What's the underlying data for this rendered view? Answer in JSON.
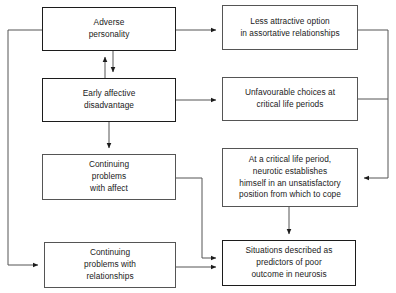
{
  "diagram": {
    "type": "flowchart",
    "colors": {
      "background": "#ffffff",
      "bold_border": "#1c1c1c",
      "thin_border": "#555555",
      "connector": "#555555",
      "text": "#1a1a1a"
    },
    "nodes": [
      {
        "id": "adverse-personality",
        "label": "Adverse\npersonality",
        "border": "bold",
        "column": "left",
        "row": 1
      },
      {
        "id": "less-attractive-option",
        "label": "Less attractive option\nin assortative relationships",
        "border": "thin",
        "column": "right",
        "row": 1
      },
      {
        "id": "early-affective-disadvantage",
        "label": "Early affective\ndisadvantage",
        "border": "bold",
        "column": "left",
        "row": 2
      },
      {
        "id": "unfavourable-choices",
        "label": "Unfavourable choices at\ncritical life periods",
        "border": "thin",
        "column": "right",
        "row": 2
      },
      {
        "id": "continuing-problems-affect",
        "label": "Continuing\nproblems\nwith affect",
        "border": "thin",
        "column": "left",
        "row": 3
      },
      {
        "id": "critical-life-period",
        "label": "At a critical life period,\nneurotic establishes\nhimself in an unsatisfactory\nposition from which to cope",
        "border": "thin",
        "column": "right",
        "row": 3
      },
      {
        "id": "continuing-problems-relationships",
        "label": "Continuing\nproblems with\nrelationships",
        "border": "thin",
        "column": "left",
        "row": 4
      },
      {
        "id": "situations-described",
        "label": "Situations described as\npredictors of poor\noutcome in neurosis",
        "border": "bold",
        "column": "right",
        "row": 4
      }
    ],
    "edges": [
      {
        "id": "adverse-to-less-attractive",
        "from": "adverse-personality",
        "to": "less-attractive-option",
        "arrow": "single"
      },
      {
        "id": "adverse-early-up",
        "from": "early-affective-disadvantage",
        "to": "adverse-personality",
        "arrow": "single"
      },
      {
        "id": "adverse-early-down",
        "from": "adverse-personality",
        "to": "early-affective-disadvantage",
        "arrow": "single"
      },
      {
        "id": "early-to-unfavourable",
        "from": "early-affective-disadvantage",
        "to": "unfavourable-choices",
        "arrow": "single"
      },
      {
        "id": "early-to-continuing-affect",
        "from": "early-affective-disadvantage",
        "to": "continuing-problems-affect",
        "arrow": "single"
      },
      {
        "id": "less-attractive-to-critical",
        "from": "less-attractive-option",
        "to": "critical-life-period",
        "arrow": "single"
      },
      {
        "id": "unfavourable-to-critical",
        "from": "unfavourable-choices",
        "to": "critical-life-period",
        "arrow": "single"
      },
      {
        "id": "critical-to-situations",
        "from": "critical-life-period",
        "to": "situations-described",
        "arrow": "single"
      },
      {
        "id": "affect-to-situations",
        "from": "continuing-problems-affect",
        "to": "situations-described",
        "arrow": "single"
      },
      {
        "id": "relationships-to-situations",
        "from": "continuing-problems-relationships",
        "to": "situations-described",
        "arrow": "single"
      },
      {
        "id": "adverse-to-relationships-feedback",
        "from": "adverse-personality",
        "to": "continuing-problems-relationships",
        "arrow": "single"
      }
    ]
  }
}
